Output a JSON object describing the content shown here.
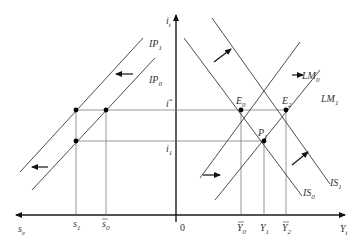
{
  "diagram": {
    "axes": {
      "vertical": {
        "label": "i",
        "sub": "t"
      },
      "horizontal_right": {
        "label": "Y",
        "sub": "t"
      },
      "horizontal_left": {
        "label": "s",
        "sub": "e"
      },
      "origin": "0"
    },
    "curves": [
      {
        "id": "IS0",
        "label": "IS",
        "sub": "0"
      },
      {
        "id": "IS1",
        "label": "IS",
        "sub": "1"
      },
      {
        "id": "LM0",
        "label": "LM",
        "sub": "0"
      },
      {
        "id": "LM1",
        "label": "LM",
        "sub": "1"
      },
      {
        "id": "IP0",
        "label": "IP",
        "sub": "0"
      },
      {
        "id": "IP1",
        "label": "IP",
        "sub": "1"
      }
    ],
    "points": [
      {
        "id": "E0",
        "label": "E",
        "sub": "0"
      },
      {
        "id": "E2",
        "label": "E",
        "sub": "2"
      },
      {
        "id": "P1",
        "label": "P",
        "sub": "1"
      }
    ],
    "rates": [
      {
        "id": "istar",
        "label": "i",
        "sup": "*"
      },
      {
        "id": "i1",
        "label": "i",
        "sub": "1"
      }
    ],
    "y_ticks": [
      {
        "id": "Ybar0",
        "label": "Y",
        "sub": "0",
        "bar": true
      },
      {
        "id": "Y1",
        "label": "Y",
        "sub": "1",
        "bar": false
      },
      {
        "id": "Ybar2",
        "label": "Y",
        "sub": "2",
        "bar": true
      }
    ],
    "s_ticks": [
      {
        "id": "s1",
        "label": "s",
        "sub": "1",
        "bar": false
      },
      {
        "id": "sbar0",
        "label": "s",
        "sub": "0",
        "bar": true
      }
    ],
    "shift_arrows": [
      {
        "id": "IS-shift",
        "direction": "up-right"
      },
      {
        "id": "IS-shift-lower",
        "direction": "right"
      },
      {
        "id": "LM-shift",
        "direction": "right"
      },
      {
        "id": "LM-shift-lower",
        "direction": "up-right"
      },
      {
        "id": "IP-shift-upper",
        "direction": "left"
      },
      {
        "id": "IP-shift-lower",
        "direction": "left"
      }
    ]
  }
}
